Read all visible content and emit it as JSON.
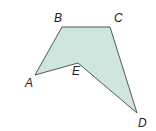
{
  "figure": {
    "type": "polygon",
    "fill_color": "#cfe6df",
    "stroke_color": "#555555",
    "vertices": [
      {
        "label": "A"
      },
      {
        "label": "B"
      },
      {
        "label": "C"
      },
      {
        "label": "D"
      },
      {
        "label": "E"
      }
    ]
  }
}
